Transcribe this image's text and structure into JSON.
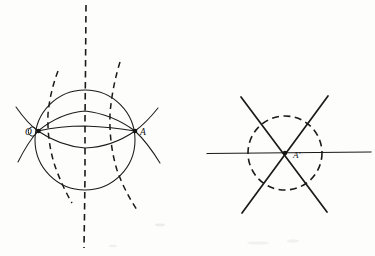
{
  "document": {
    "kind": "geometric-construction-diagram",
    "background_color": "#fdfdfc",
    "ink_color": "#1a1a1a",
    "width": 375,
    "height": 256
  },
  "figures": [
    {
      "id": "left-figure",
      "name": "circle-with-intersecting-arcs",
      "center": {
        "x": 85,
        "y": 140
      },
      "circle_radius": 50,
      "labels": [
        {
          "id": "label-o",
          "text": "O",
          "x": 27,
          "y": 134
        },
        {
          "id": "label-a",
          "text": "A",
          "x": 142,
          "y": 133
        }
      ],
      "points": [
        {
          "id": "point-o",
          "text": "O",
          "x": 38,
          "y": 131
        },
        {
          "id": "point-a",
          "text": "A",
          "x": 135,
          "y": 131
        }
      ],
      "elements": [
        "solid-circle",
        "vertical-dashed-axis",
        "solid-arc-upper",
        "solid-arc-lower",
        "solid-lens-arc",
        "dashed-arc-left",
        "dashed-arc-right"
      ]
    },
    {
      "id": "right-figure",
      "name": "dashed-circle-with-six-spokes",
      "center": {
        "x": 285,
        "y": 153
      },
      "circle_radius": 37,
      "labels": [
        {
          "id": "label-a-prime",
          "text": "A'",
          "x": 296,
          "y": 159
        }
      ],
      "points": [
        {
          "id": "point-a-prime",
          "text": "A'",
          "x": 285,
          "y": 153
        }
      ],
      "elements": [
        "dashed-circle",
        "horizontal-spoke-line",
        "diagonal-spoke-line-up-right",
        "diagonal-spoke-line-down-right"
      ],
      "spoke_angles_degrees": [
        0,
        60,
        120,
        180,
        240,
        300
      ]
    }
  ]
}
